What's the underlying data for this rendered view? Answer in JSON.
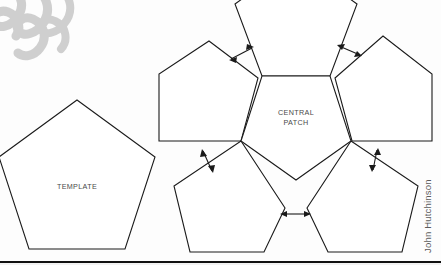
{
  "figure": {
    "title_hidden": "",
    "labels": {
      "template": "TEMPLATE",
      "central_line1": "CENTRAL",
      "central_line2": "PATCH"
    },
    "credit": "John Hutchinson",
    "colors": {
      "stroke": "#1a1a1a",
      "fill": "#ffffff",
      "label_text": "#4a4a4a",
      "credit_text": "#5b5b5b",
      "watermark": "#c8c8c8",
      "page_background": "#fdfdfd",
      "rule": "#111111"
    },
    "shapes": [
      {
        "name": "template-pentagon",
        "role": "template",
        "label": "TEMPLATE",
        "points": "77,100 155,157 125,249 29,249 -1,157",
        "label_x": 77,
        "label_y": 187
      },
      {
        "name": "central-pentagon",
        "role": "central-patch",
        "label": "CENTRAL PATCH",
        "points": "262,76 330,76 351,141 296,180 241,141",
        "label_x": 296,
        "label_y": 117
      },
      {
        "name": "top-pentagon",
        "role": "flap",
        "label": "",
        "points": "296,-40 357,4 330,76 262,76 235,4",
        "label_x": 0,
        "label_y": 0
      },
      {
        "name": "upper-left-pentagon",
        "role": "flap",
        "label": "",
        "points": "209,41 258,78 241,141 159,141 159,74",
        "label_x": 0,
        "label_y": 0
      },
      {
        "name": "upper-right-pentagon",
        "role": "flap",
        "label": "",
        "points": "383,36 432,74 432,141 352,141 335,78",
        "label_x": 0,
        "label_y": 0
      },
      {
        "name": "lower-left-pentagon",
        "role": "flap",
        "label": "",
        "points": "241,141 285,208 264,252 190,252 174,186"
      },
      {
        "name": "lower-right-pentagon",
        "role": "flap",
        "label": "",
        "points": "351,141 418,186 402,252 328,252 307,208"
      }
    ],
    "gap_arrows": [
      {
        "name": "gap-arrow-top-left",
        "description": "double-headed arrow between upper-left flap and top flap",
        "x1": 229,
        "y1": 60,
        "x2": 254,
        "y2": 47
      },
      {
        "name": "gap-arrow-top-right",
        "description": "double-headed arrow between top flap and upper-right flap",
        "x1": 337,
        "y1": 45,
        "x2": 362,
        "y2": 56
      },
      {
        "name": "gap-arrow-left",
        "description": "double-headed arrow between upper-left flap and lower-left flap",
        "x1": 202,
        "y1": 149,
        "x2": 213,
        "y2": 173
      },
      {
        "name": "gap-arrow-right",
        "description": "double-headed arrow between upper-right flap and lower-right flap",
        "x1": 378,
        "y1": 148,
        "x2": 372,
        "y2": 172
      },
      {
        "name": "gap-arrow-bottom",
        "description": "double-headed arrow between lower-left flap and lower-right flap",
        "x1": 280,
        "y1": 214,
        "x2": 311,
        "y2": 214
      }
    ],
    "watermark": {
      "name": "script-watermark",
      "description": "faded gray handwritten script mark, top-left corner"
    }
  }
}
